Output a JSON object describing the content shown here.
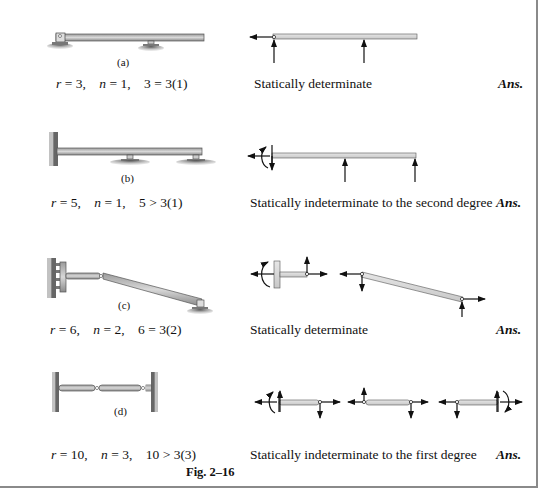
{
  "figure": {
    "caption": "Fig. 2–16",
    "rows": [
      {
        "label": "(a)",
        "equation": {
          "r": "3",
          "n": "1",
          "relation": "3 = 3(1)"
        },
        "result": "Statically determinate",
        "ans": "Ans."
      },
      {
        "label": "(b)",
        "equation": {
          "r": "5",
          "n": "1",
          "relation": "5 > 3(1)"
        },
        "result": "Statically indeterminate to the second degree",
        "ans": "Ans."
      },
      {
        "label": "(c)",
        "equation": {
          "r": "6",
          "n": "2",
          "relation": "6 = 3(2)"
        },
        "result": "Statically determinate",
        "ans": "Ans."
      },
      {
        "label": "(d)",
        "equation": {
          "r": "10",
          "n": "3",
          "relation": "10 > 3(3)"
        },
        "result": "Statically indeterminate to the first degree",
        "ans": "Ans."
      }
    ],
    "symbols": {
      "r": "r",
      "n": "n",
      "eq": " = ",
      "sep": ","
    }
  }
}
